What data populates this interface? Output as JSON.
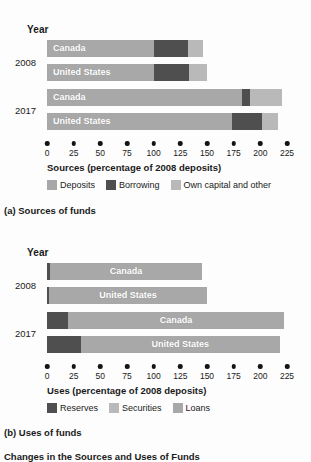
{
  "figure": {
    "title": "Changes in the Sources and Uses of Funds"
  },
  "panels": [
    {
      "key": "sources",
      "caption": "(a) Sources of funds",
      "year_header": "Year",
      "axis_title": "Sources (percentage of 2008 deposits)",
      "years": [
        "2008",
        "2017"
      ],
      "legend": [
        {
          "label": "Deposits",
          "color": "#a8a8a8"
        },
        {
          "label": "Borrowing",
          "color": "#4f4f4f"
        },
        {
          "label": "Own capital and other",
          "color": "#b9b9b9"
        }
      ],
      "bars": [
        {
          "label": "Canada",
          "year": "2008"
        },
        {
          "label": "United States",
          "year": "2008"
        },
        {
          "label": "Canada",
          "year": "2017"
        },
        {
          "label": "United States",
          "year": "2017"
        }
      ]
    },
    {
      "key": "uses",
      "caption": "(b) Uses of funds",
      "year_header": "Year",
      "axis_title": "Uses (percentage of 2008 deposits)",
      "years": [
        "2008",
        "2017"
      ],
      "legend": [
        {
          "label": "Reserves",
          "color": "#4f4f4f"
        },
        {
          "label": "Securities",
          "color": "#b9b9b9"
        },
        {
          "label": "Loans",
          "color": "#a8a8a8"
        }
      ],
      "bars": [
        {
          "label": "Canada",
          "year": "2008"
        },
        {
          "label": "United States",
          "year": "2008"
        },
        {
          "label": "Canada",
          "year": "2017"
        },
        {
          "label": "United States",
          "year": "2017"
        }
      ]
    }
  ],
  "chart_data": [
    {
      "type": "bar",
      "orientation": "horizontal",
      "stacked": true,
      "title": "(a) Sources of funds",
      "xlabel": "Sources (percentage of 2008 deposits)",
      "ylabel": "Year",
      "xlim": [
        0,
        225
      ],
      "xticks": [
        0,
        25,
        50,
        75,
        100,
        125,
        150,
        175,
        200,
        225
      ],
      "grid": false,
      "legend_position": "below-axis",
      "categories": [
        "2008 Canada",
        "2008 United States",
        "2017 Canada",
        "2017 United States"
      ],
      "series": [
        {
          "name": "Deposits",
          "color": "#a8a8a8",
          "values": [
            100,
            100,
            183,
            173
          ]
        },
        {
          "name": "Borrowing",
          "color": "#4f4f4f",
          "values": [
            32,
            33,
            7,
            29
          ]
        },
        {
          "name": "Own capital and other",
          "color": "#b9b9b9",
          "values": [
            14,
            17,
            30,
            15
          ]
        }
      ],
      "totals": [
        146,
        150,
        220,
        217
      ]
    },
    {
      "type": "bar",
      "orientation": "horizontal",
      "stacked": true,
      "title": "(b) Uses of funds",
      "xlabel": "Uses (percentage of 2008 deposits)",
      "ylabel": "Year",
      "xlim": [
        0,
        225
      ],
      "xticks": [
        0,
        25,
        50,
        75,
        100,
        125,
        150,
        175,
        200,
        225
      ],
      "grid": false,
      "legend_position": "below-axis",
      "categories": [
        "2008 Canada",
        "2008 United States",
        "2017 Canada",
        "2017 United States"
      ],
      "series": [
        {
          "name": "Reserves",
          "color": "#4f4f4f",
          "values": [
            3,
            2,
            20,
            32
          ]
        },
        {
          "name": "Securities",
          "color": "#b9b9b9",
          "values": [
            0,
            0,
            0,
            0
          ]
        },
        {
          "name": "Loans",
          "color": "#a8a8a8",
          "values": [
            142,
            148,
            202,
            186
          ]
        }
      ],
      "totals": [
        145,
        150,
        222,
        218
      ]
    }
  ]
}
